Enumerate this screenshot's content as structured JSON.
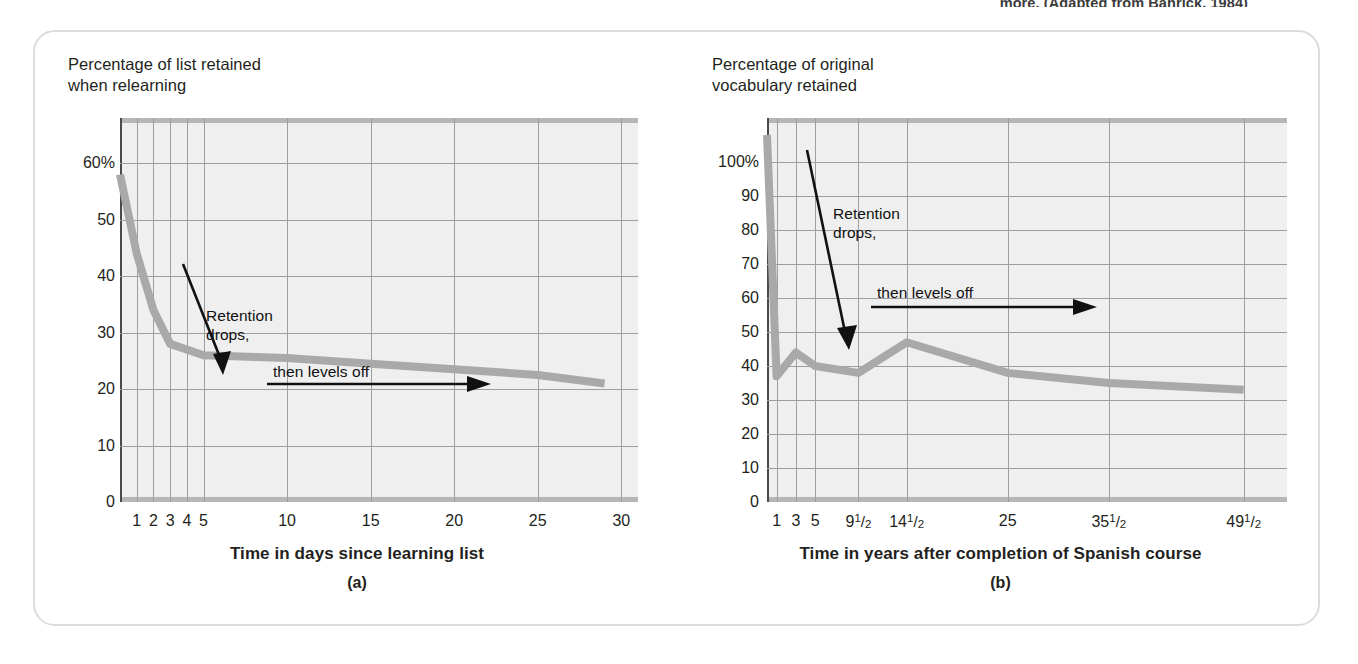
{
  "top_caption": "more. (Adapted from Bahrick, 1984)",
  "colors": {
    "data_line": "#a9a9a9",
    "plot_background": "#efefef",
    "gridline": "#9e9e9e",
    "axis": "#4a4a4a",
    "card_border": "#dcdcdc",
    "text": "#231f20"
  },
  "panels": [
    {
      "letter": "(a)",
      "y_axis_title": "Percentage of list retained\nwhen relearning",
      "x_axis_label": "Time in days since learning list",
      "annotation_drop": "Retention\ndrops,",
      "annotation_level": "then levels off",
      "y_ticks": [
        "60%",
        "50",
        "40",
        "30",
        "20",
        "10",
        "0"
      ],
      "x_ticks": [
        "1",
        "2",
        "3",
        "4",
        "5",
        "10",
        "15",
        "20",
        "25",
        "30"
      ]
    },
    {
      "letter": "(b)",
      "y_axis_title": "Percentage of original\nvocabulary retained",
      "x_axis_label": "Time in years after completion of Spanish course",
      "annotation_drop": "Retention\ndrops,",
      "annotation_level": "then levels off",
      "y_ticks": [
        "100%",
        "90",
        "80",
        "70",
        "60",
        "50",
        "40",
        "30",
        "20",
        "10",
        "0"
      ],
      "x_ticks": [
        "1",
        "3",
        "5",
        "9½",
        "14½",
        "25",
        "35½",
        "49½"
      ]
    }
  ],
  "chart_data": [
    {
      "type": "line",
      "panel": "(a)",
      "title": "Percentage of list retained when relearning",
      "xlabel": "Time in days since learning list",
      "ylabel": "Percentage of list retained when relearning",
      "xlim": [
        0,
        31
      ],
      "ylim": [
        0,
        68
      ],
      "x_tick_values": [
        1,
        2,
        3,
        4,
        5,
        10,
        15,
        20,
        25,
        30
      ],
      "x_tick_labels": [
        "1",
        "2",
        "3",
        "4",
        "5",
        "10",
        "15",
        "20",
        "25",
        "30"
      ],
      "y_tick_values": [
        0,
        10,
        20,
        30,
        40,
        50,
        60
      ],
      "y_tick_labels": [
        "0",
        "10",
        "20",
        "30",
        "40",
        "50",
        "60%"
      ],
      "grid": true,
      "legend": "none",
      "x": [
        0,
        1,
        2,
        3,
        5,
        10,
        15,
        20,
        25,
        29
      ],
      "values": [
        58,
        44,
        34,
        28,
        26,
        25.5,
        24.5,
        23.5,
        22.5,
        21
      ],
      "annotations": [
        "Retention drops,",
        "then levels off"
      ]
    },
    {
      "type": "line",
      "panel": "(b)",
      "title": "Percentage of original vocabulary retained",
      "xlabel": "Time in years after completion of Spanish course",
      "ylabel": "Percentage of original vocabulary retained",
      "xlim": [
        0,
        54
      ],
      "ylim": [
        0,
        113
      ],
      "x_tick_values": [
        1,
        3,
        5,
        9.5,
        14.5,
        25,
        35.5,
        49.5
      ],
      "x_tick_labels": [
        "1",
        "3",
        "5",
        "9½",
        "14½",
        "25",
        "35½",
        "49½"
      ],
      "y_tick_values": [
        0,
        10,
        20,
        30,
        40,
        50,
        60,
        70,
        80,
        90,
        100
      ],
      "y_tick_labels": [
        "0",
        "10",
        "20",
        "30",
        "40",
        "50",
        "60",
        "70",
        "80",
        "90",
        "100%"
      ],
      "grid": true,
      "legend": "none",
      "x": [
        0,
        1,
        3,
        5,
        9.5,
        14.5,
        25,
        35.5,
        49.5
      ],
      "values": [
        108,
        37,
        44,
        40,
        38,
        47,
        38,
        35,
        33
      ],
      "annotations": [
        "Retention drops,",
        "then levels off"
      ]
    }
  ]
}
